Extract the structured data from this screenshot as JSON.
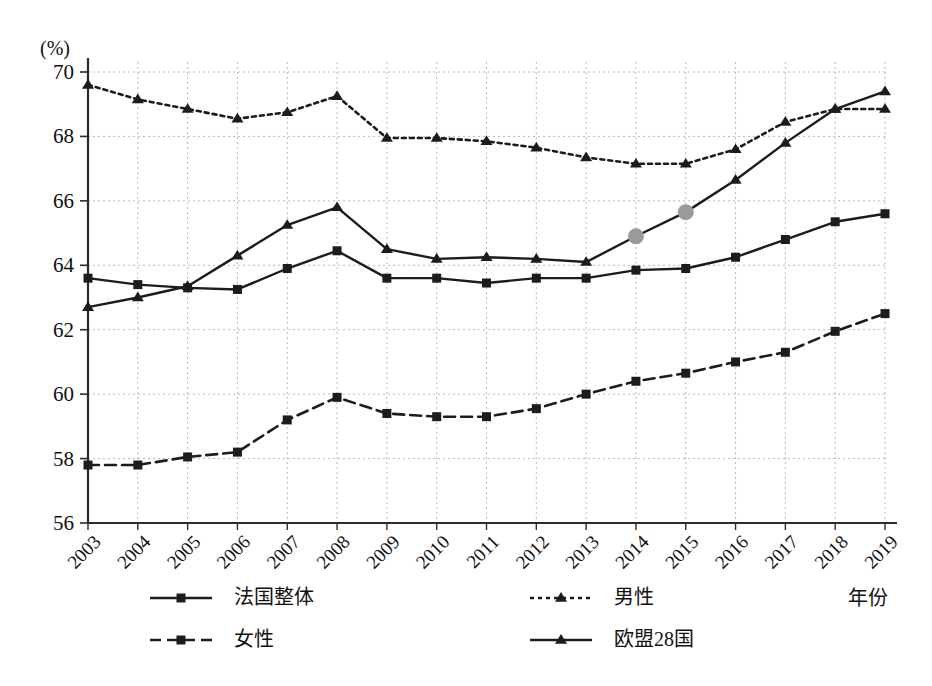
{
  "chart_data": {
    "type": "line",
    "title": "",
    "xlabel": "年份",
    "ylabel": "(%)",
    "ylim": [
      56,
      70
    ],
    "yticks": [
      56,
      58,
      60,
      62,
      64,
      66,
      68,
      70
    ],
    "grid": true,
    "legend_position": "bottom",
    "categories": [
      "2003",
      "2004",
      "2005",
      "2006",
      "2007",
      "2008",
      "2009",
      "2010",
      "2011",
      "2012",
      "2013",
      "2014",
      "2015",
      "2016",
      "2017",
      "2018",
      "2019"
    ],
    "series": [
      {
        "name": "法国整体",
        "style": "solid",
        "marker": "square",
        "color": "#1c1c1c",
        "values": [
          63.6,
          63.4,
          63.3,
          63.25,
          63.9,
          64.45,
          63.6,
          63.6,
          63.45,
          63.6,
          63.6,
          63.85,
          63.9,
          64.25,
          64.8,
          65.35,
          65.6
        ]
      },
      {
        "name": "男性",
        "style": "dotted",
        "marker": "triangle",
        "color": "#1c1c1c",
        "values": [
          69.6,
          69.15,
          68.85,
          68.55,
          68.75,
          69.25,
          67.95,
          67.95,
          67.85,
          67.65,
          67.35,
          67.15,
          67.15,
          67.6,
          68.45,
          68.85,
          68.85
        ]
      },
      {
        "name": "女性",
        "style": "dashed",
        "marker": "square",
        "color": "#1c1c1c",
        "values": [
          57.8,
          57.8,
          58.05,
          58.2,
          59.2,
          59.9,
          59.4,
          59.3,
          59.3,
          59.55,
          60.0,
          60.4,
          60.65,
          61.0,
          61.3,
          61.95,
          62.5
        ]
      },
      {
        "name": "欧盟28国",
        "style": "solid",
        "marker": "triangle",
        "color": "#1c1c1c",
        "values": [
          62.7,
          63.0,
          63.35,
          64.3,
          65.25,
          65.8,
          64.5,
          64.2,
          64.25,
          64.2,
          64.1,
          64.9,
          65.65,
          66.65,
          67.8,
          68.85,
          69.4
        ],
        "highlighted_points": [
          {
            "category": "2014",
            "value": 64.9,
            "marker": "circle",
            "color": "#9a9a9a"
          },
          {
            "category": "2015",
            "value": 65.65,
            "marker": "circle",
            "color": "#9a9a9a"
          }
        ]
      }
    ]
  },
  "legend": {
    "entries": [
      {
        "label": "法国整体",
        "style": "solid",
        "marker": "square"
      },
      {
        "label": "男性",
        "style": "dotted",
        "marker": "triangle"
      },
      {
        "label": "女性",
        "style": "dashed",
        "marker": "square"
      },
      {
        "label": "欧盟28国",
        "style": "solid",
        "marker": "triangle"
      }
    ]
  },
  "axis": {
    "y_unit": "(%)",
    "x_title": "年份"
  }
}
